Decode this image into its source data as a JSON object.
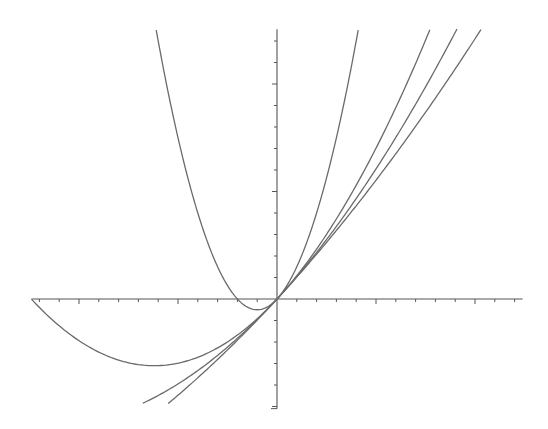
{
  "chart_data": {
    "type": "line",
    "title": "",
    "xlabel": "",
    "ylabel": "",
    "xlim": [
      -12.4,
      12.4
    ],
    "ylim": [
      -5.1,
      12.55
    ],
    "grid": false,
    "legend": null,
    "x_ticks": {
      "step": 1,
      "major_every": 5,
      "labels": []
    },
    "y_ticks": {
      "step": 1,
      "major_every": 5,
      "labels": []
    },
    "series": [
      {
        "name": "curve-steep-parabola",
        "formula": "y = x + 0.5*x^2",
        "x_range": [
          -6.1,
          4.1
        ],
        "color": "#6a6a6a"
      },
      {
        "name": "curve-wide-parabola",
        "formula": "y = x + x^2/12.4",
        "x_range": [
          -12.4,
          7.72
        ],
        "color": "#6a6a6a"
      },
      {
        "name": "curve-middle",
        "formula": "y = x + 0.042*x^2",
        "x_range": [
          -6.77,
          9.09
        ],
        "color": "#6a6a6a"
      },
      {
        "name": "curve-flattest",
        "formula": "y = x + 0.021*x^2",
        "x_range": [
          -5.5,
          10.3
        ],
        "color": "#6a6a6a"
      }
    ],
    "coefficients": [
      0.5,
      0.0806,
      0.042,
      0.021
    ]
  },
  "layout": {
    "origin_px": [
      277,
      299
    ],
    "x_unit_px": 19.8,
    "y_unit_px": 21.5,
    "axis_color": "#555555",
    "background": "#ffffff"
  }
}
